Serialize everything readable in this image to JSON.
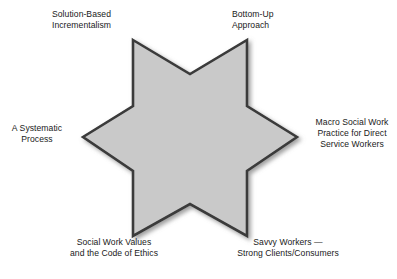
{
  "diagram": {
    "type": "hexagram-star",
    "shape_name": "six-pointed-star",
    "fill_color": "#c9c9c9",
    "stroke_color": "#3a3a3a",
    "background_color": "#ffffff",
    "text_color": "#1a1a1a",
    "points_count": 6,
    "labels": [
      {
        "id": "solution-based-incrementalism",
        "position": "top-left",
        "text": "Solution-Based\nIncrementalism"
      },
      {
        "id": "bottom-up-approach",
        "position": "top-right",
        "text": "Bottom-Up\nApproach"
      },
      {
        "id": "a-systematic-process",
        "position": "left",
        "text": "A Systematic\nProcess"
      },
      {
        "id": "macro-social-work-practice",
        "position": "right",
        "text": "Macro Social Work\nPractice for Direct\nService Workers"
      },
      {
        "id": "social-work-values",
        "position": "bottom-left",
        "text": "Social Work Values\nand the Code of Ethics"
      },
      {
        "id": "savvy-workers",
        "position": "bottom-right",
        "text": "Savvy Workers —\nStrong Clients/Consumers"
      }
    ]
  }
}
